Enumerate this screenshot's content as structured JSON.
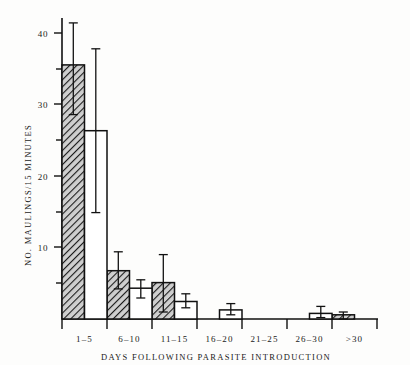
{
  "chart_data": {
    "type": "bar",
    "title": "",
    "xlabel": "DAYS FOLLOWING PARASITE INTRODUCTION",
    "ylabel": "NO. MAULINGS/15 MINUTES",
    "categories": [
      "1–5",
      "6–10",
      "11–15",
      "16–20",
      "21–25",
      "26–30",
      ">30"
    ],
    "ylim": [
      0,
      43
    ],
    "yticks": [
      10,
      20,
      30,
      40
    ],
    "ytick_labels": [
      "10",
      "20",
      "30",
      "40"
    ],
    "yticks_minor": [
      5,
      15,
      25,
      35
    ],
    "grid": false,
    "legend": "none",
    "series": [
      {
        "name": "hatched",
        "style": "hatched",
        "values": [
          36.3,
          6.9,
          5.2,
          0,
          0,
          0,
          0.6
        ],
        "err_low": [
          29.2,
          4.3,
          1.0,
          0,
          0,
          0,
          0
        ],
        "err_high": [
          42.3,
          9.6,
          9.2,
          0,
          0,
          0,
          1.0
        ]
      },
      {
        "name": "open",
        "style": "open",
        "values": [
          26.9,
          4.4,
          2.5,
          1.3,
          0,
          0.8,
          0
        ],
        "err_low": [
          15.2,
          3.0,
          1.6,
          0.6,
          0,
          0.2,
          0
        ],
        "err_high": [
          38.6,
          5.6,
          3.6,
          2.2,
          0,
          1.8,
          0
        ]
      }
    ]
  },
  "axis": {
    "y_title": "NO. MAULINGS/15 MINUTES",
    "x_title": "DAYS FOLLOWING PARASITE INTRODUCTION"
  },
  "ticks": {
    "y": [
      "40",
      "30",
      "20",
      "10"
    ]
  },
  "categories": {
    "c0": "1–5",
    "c1": "6–10",
    "c2": "11–15",
    "c3": "16–20",
    "c4": "21–25",
    "c5": "26–30",
    "c6": ">30"
  },
  "colors": {
    "ink": "#111111",
    "paper": "#fdfdfc",
    "bar_fill_open": "#ffffff",
    "bar_fill_hatch": "#b9b9b9"
  }
}
